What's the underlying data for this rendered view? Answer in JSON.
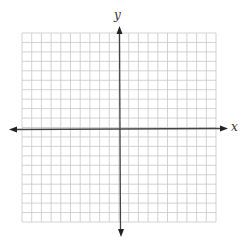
{
  "axes": {
    "x_label": "x",
    "y_label": "y"
  },
  "grid": {
    "columns": 20,
    "rows": 20,
    "line_color": "#c8c8c8",
    "axis_color": "#444444"
  }
}
